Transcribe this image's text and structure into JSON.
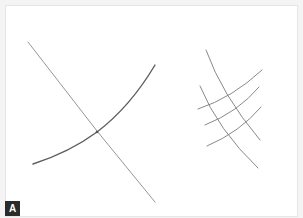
{
  "figure": {
    "panel_label": "A",
    "colors": {
      "background": "#ffffff",
      "stroke": "#6e6e6e",
      "label_bg": "#2b2b2b",
      "label_text": "#ffffff"
    },
    "left_sketch": {
      "description": "single crossing of straight line and curve",
      "straight_line": [
        [
          28,
          42
        ],
        [
          155,
          202
        ]
      ],
      "curve": [
        [
          33,
          164
        ],
        [
          97,
          132
        ],
        [
          155,
          65
        ]
      ]
    },
    "right_sketch": {
      "description": "grid of crossing lines",
      "descending_lines": [
        [
          [
            206,
            50
          ],
          [
            260,
            140
          ]
        ],
        [
          [
            200,
            86
          ],
          [
            258,
            168
          ]
        ]
      ],
      "ascending_lines": [
        [
          [
            198,
            109
          ],
          [
            262,
            70
          ]
        ],
        [
          [
            205,
            125
          ],
          [
            259,
            87
          ]
        ],
        [
          [
            207,
            146
          ],
          [
            261,
            107
          ]
        ]
      ]
    }
  }
}
